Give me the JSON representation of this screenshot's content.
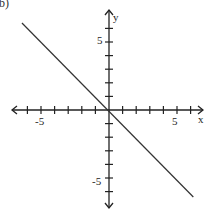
{
  "figure_label": "b)",
  "chart_data": {
    "type": "line",
    "title": "",
    "xlabel": "x",
    "ylabel": "y",
    "xlim": [
      -7,
      7
    ],
    "ylim": [
      -7,
      7
    ],
    "grid": false,
    "x_tick_labels": [
      "-5",
      "5"
    ],
    "y_tick_labels": [
      "5",
      "-5"
    ],
    "tick_step": 1,
    "series": [
      {
        "name": "y = -x",
        "x": [
          -6.4,
          6.2
        ],
        "y": [
          6.4,
          -6.4
        ],
        "color": "#333333"
      }
    ]
  },
  "colors": {
    "axis": "#222222",
    "line": "#333333",
    "background": "#ffffff"
  }
}
